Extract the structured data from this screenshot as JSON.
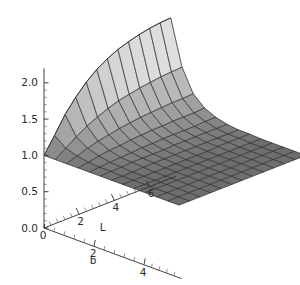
{
  "figure": {
    "kind": "3d-surface-plot",
    "background_color": "#ffffff",
    "axis_color": "#2f2f2f",
    "mesh_line_color": "#3a3a3a",
    "surface_high_color": "#f2f2f2",
    "surface_low_color": "#6e6e6e"
  },
  "chart_data": {
    "type": "surface",
    "title": "",
    "xlabel": "b",
    "ylabel": "L",
    "zlabel": "",
    "projection": "3d",
    "grid": true,
    "legend": null,
    "axes": {
      "z": {
        "label": "",
        "ticks": [
          "0.0",
          "0.5",
          "1.0",
          "1.5",
          "2.0"
        ],
        "tick_values": [
          0.0,
          0.5,
          1.0,
          1.5,
          2.0
        ],
        "range": [
          0.0,
          2.2
        ],
        "minor_ticks_per_interval": 4
      },
      "L": {
        "label": "L",
        "ticks": [
          "2",
          "4",
          "6"
        ],
        "tick_values": [
          2,
          4,
          6
        ],
        "range": [
          0,
          7.5
        ],
        "minor_ticks_per_interval": 4
      },
      "b": {
        "label": "b",
        "ticks": [
          "0",
          "2",
          "4"
        ],
        "tick_values": [
          0,
          2,
          4
        ],
        "range": [
          0,
          5.5
        ],
        "minor_ticks_per_interval": 4
      }
    },
    "origin_tick": "0",
    "surface_description": "Value near 1.0 over most of the (b, L) domain; rises steeply toward 2.2 as b approaches 0 with large L; sharp ridge along the small-b edge that decays to the flat plateau at 1.0.",
    "b": [
      0.0,
      0.45,
      0.9,
      1.35,
      1.8,
      2.25,
      2.7,
      3.15,
      3.6,
      4.05,
      4.5,
      4.95,
      5.4
    ],
    "L": [
      0.0,
      0.6,
      1.2,
      1.8,
      2.4,
      3.0,
      3.6,
      4.2,
      4.8,
      5.4,
      6.0,
      6.6,
      7.2
    ],
    "z": [
      [
        1.0,
        1.22,
        1.45,
        1.63,
        1.78,
        1.9,
        1.99,
        2.06,
        2.11,
        2.15,
        2.18,
        2.2,
        2.21
      ],
      [
        1.0,
        1.1,
        1.2,
        1.29,
        1.36,
        1.42,
        1.47,
        1.5,
        1.53,
        1.55,
        1.57,
        1.58,
        1.59
      ],
      [
        1.0,
        1.05,
        1.1,
        1.14,
        1.17,
        1.2,
        1.22,
        1.24,
        1.25,
        1.26,
        1.27,
        1.27,
        1.28
      ],
      [
        1.0,
        1.02,
        1.05,
        1.07,
        1.08,
        1.1,
        1.11,
        1.12,
        1.12,
        1.13,
        1.13,
        1.13,
        1.14
      ],
      [
        1.0,
        1.01,
        1.02,
        1.03,
        1.04,
        1.05,
        1.05,
        1.06,
        1.06,
        1.06,
        1.06,
        1.07,
        1.07
      ],
      [
        1.0,
        1.01,
        1.01,
        1.02,
        1.02,
        1.02,
        1.02,
        1.03,
        1.03,
        1.03,
        1.03,
        1.03,
        1.03
      ],
      [
        1.0,
        1.0,
        1.0,
        1.01,
        1.01,
        1.01,
        1.01,
        1.01,
        1.01,
        1.01,
        1.01,
        1.01,
        1.01
      ],
      [
        1.0,
        1.0,
        1.0,
        1.0,
        1.0,
        1.0,
        1.0,
        1.0,
        1.0,
        1.01,
        1.01,
        1.01,
        1.01
      ],
      [
        1.0,
        1.0,
        1.0,
        1.0,
        1.0,
        1.0,
        1.0,
        1.0,
        1.0,
        1.0,
        1.0,
        1.0,
        1.0
      ],
      [
        1.0,
        1.0,
        1.0,
        1.0,
        1.0,
        1.0,
        1.0,
        1.0,
        1.0,
        1.0,
        1.0,
        1.0,
        1.0
      ],
      [
        1.0,
        1.0,
        1.0,
        1.0,
        1.0,
        1.0,
        1.0,
        1.0,
        1.0,
        1.0,
        1.0,
        1.0,
        1.0
      ],
      [
        1.0,
        1.0,
        1.0,
        1.0,
        1.0,
        1.0,
        1.0,
        1.0,
        1.0,
        1.0,
        1.0,
        1.0,
        1.0
      ],
      [
        1.0,
        1.0,
        1.0,
        1.0,
        1.0,
        1.0,
        1.0,
        1.0,
        1.0,
        1.0,
        1.0,
        1.0,
        1.0
      ]
    ]
  },
  "labels": {
    "z_0": "0.0",
    "z_1": "0.5",
    "z_2": "1.0",
    "z_3": "1.5",
    "z_4": "2.0",
    "L_1": "2",
    "L_2": "4",
    "L_3": "6",
    "L_title": "L",
    "b_0": "0",
    "b_1": "2",
    "b_2": "4",
    "b_title": "b"
  }
}
